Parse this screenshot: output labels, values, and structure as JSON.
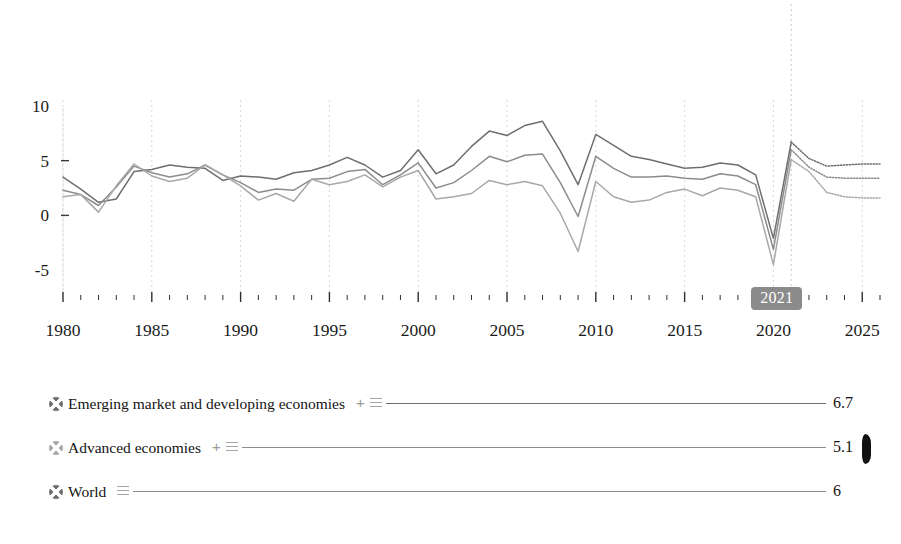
{
  "chart_data": {
    "type": "line",
    "title": "",
    "subtitle": "",
    "xlabel": "",
    "ylabel": "",
    "xlim": [
      1980,
      2026
    ],
    "ylim": [
      -7,
      11
    ],
    "yticks": [
      -5,
      0,
      5,
      10
    ],
    "ytick_labels": [
      "-5",
      "0",
      "5",
      "10"
    ],
    "xticks_major": [
      1980,
      1985,
      1990,
      1995,
      2000,
      2005,
      2010,
      2015,
      2020,
      2025
    ],
    "xtick_labels": [
      "1980",
      "1985",
      "1990",
      "1995",
      "2000",
      "2005",
      "2010",
      "2015",
      "2020",
      "2025"
    ],
    "grid": "vertical-dashed-at-major-xticks",
    "legend_position": "below-plot",
    "forecast_start_year": 2021,
    "forecast_marker_label": "2021",
    "x": [
      1980,
      1981,
      1982,
      1983,
      1984,
      1985,
      1986,
      1987,
      1988,
      1989,
      1990,
      1991,
      1992,
      1993,
      1994,
      1995,
      1996,
      1997,
      1998,
      1999,
      2000,
      2001,
      2002,
      2003,
      2004,
      2005,
      2006,
      2007,
      2008,
      2009,
      2010,
      2011,
      2012,
      2013,
      2014,
      2015,
      2016,
      2017,
      2018,
      2019,
      2020,
      2021,
      2022,
      2023,
      2024,
      2025,
      2026
    ],
    "series": [
      {
        "name": "Emerging market and developing economies",
        "color": "#6e6e6e",
        "end_value": 6.7,
        "end_value_label": "6.7",
        "values": [
          3.5,
          2.4,
          1.2,
          1.5,
          4.0,
          4.2,
          4.6,
          4.4,
          4.3,
          3.2,
          3.6,
          3.5,
          3.3,
          3.9,
          4.1,
          4.6,
          5.3,
          4.6,
          3.5,
          4.1,
          6.0,
          3.8,
          4.6,
          6.3,
          7.7,
          7.3,
          8.2,
          8.6,
          5.9,
          2.8,
          7.4,
          6.4,
          5.4,
          5.1,
          4.7,
          4.3,
          4.4,
          4.8,
          4.6,
          3.7,
          -2.1,
          6.7,
          5.2,
          4.5,
          4.6,
          4.7,
          4.7
        ]
      },
      {
        "name": "World",
        "color": "#8c8c8c",
        "end_value": 6,
        "end_value_label": "6",
        "values": [
          2.3,
          1.9,
          0.9,
          2.6,
          4.5,
          3.9,
          3.5,
          3.8,
          4.6,
          3.7,
          3.0,
          2.1,
          2.4,
          2.3,
          3.3,
          3.4,
          4.0,
          4.2,
          2.8,
          3.7,
          4.8,
          2.5,
          3.0,
          4.1,
          5.4,
          4.9,
          5.5,
          5.6,
          3.0,
          -0.1,
          5.4,
          4.3,
          3.5,
          3.5,
          3.6,
          3.4,
          3.3,
          3.8,
          3.6,
          2.8,
          -3.1,
          6.0,
          4.4,
          3.5,
          3.4,
          3.4,
          3.4
        ]
      },
      {
        "name": "Advanced economies",
        "color": "#a8a8a8",
        "end_value": 5.1,
        "end_value_label": "5.1",
        "values": [
          1.7,
          1.9,
          0.3,
          2.7,
          4.7,
          3.6,
          3.1,
          3.4,
          4.6,
          3.7,
          2.7,
          1.4,
          2.0,
          1.3,
          3.3,
          2.8,
          3.1,
          3.7,
          2.6,
          3.5,
          4.1,
          1.5,
          1.7,
          2.0,
          3.2,
          2.8,
          3.1,
          2.7,
          0.2,
          -3.3,
          3.1,
          1.7,
          1.2,
          1.4,
          2.1,
          2.4,
          1.8,
          2.5,
          2.3,
          1.7,
          -4.5,
          5.1,
          4.0,
          2.1,
          1.7,
          1.6,
          1.6
        ]
      }
    ]
  },
  "axes": {
    "y_labels": [
      "10",
      "5",
      "0",
      "-5"
    ],
    "x_labels": [
      "1980",
      "1985",
      "1990",
      "1995",
      "2000",
      "2005",
      "2010",
      "2015",
      "2020",
      "2025"
    ]
  },
  "year_badge": {
    "label": "2021"
  },
  "legend": {
    "items": [
      {
        "bullet_color": "#6e6e6e",
        "label": "Emerging market and developing economies",
        "plus": "+",
        "menu_icon": "hamburger-icon",
        "rule_color": "#6e6e6e",
        "value": "6.7"
      },
      {
        "bullet_color": "#a8a8a8",
        "label": "Advanced economies",
        "plus": "+",
        "menu_icon": "hamburger-icon",
        "rule_color": "#8c8c8c",
        "value": "5.1"
      },
      {
        "bullet_color": "#6e6e6e",
        "label": "World",
        "plus": "",
        "menu_icon": "hamburger-icon",
        "rule_color": "#8c8c8c",
        "value": "6"
      }
    ]
  }
}
